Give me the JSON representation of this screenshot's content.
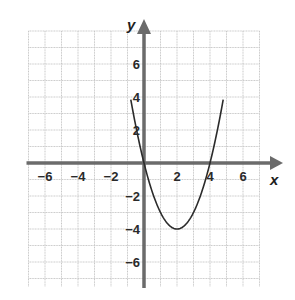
{
  "chart_data": {
    "type": "line",
    "title": "",
    "xlabel": "x",
    "ylabel": "y",
    "xlim": [
      -7,
      7
    ],
    "ylim": [
      -7.5,
      8
    ],
    "grid": true,
    "x_ticks": [
      -6,
      -4,
      -2,
      2,
      4,
      6
    ],
    "y_ticks": [
      -6,
      -4,
      -2,
      2,
      4,
      6
    ],
    "x_tick_labels": [
      "−6",
      "−4",
      "−2",
      "2",
      "4",
      "6"
    ],
    "y_tick_labels": [
      "−6",
      "−4",
      "−2",
      "2",
      "4",
      "6"
    ],
    "series": [
      {
        "name": "y = x^2 - 4x",
        "equation": "y = x^2 - 4x",
        "vertex": [
          2,
          -4
        ],
        "x_intercepts": [
          0,
          4
        ],
        "x": [
          -0.8,
          -0.5,
          0,
          0.5,
          1,
          1.5,
          2,
          2.5,
          3,
          3.5,
          4,
          4.5,
          4.8
        ],
        "values": [
          3.84,
          2.25,
          0,
          -1.75,
          -3,
          -3.75,
          -4,
          -3.75,
          -3,
          -1.75,
          0,
          2.25,
          3.84
        ]
      }
    ]
  },
  "colors": {
    "grid": "#c8c8c8",
    "axis": "#6b6b6b",
    "curve": "#2b2b2b",
    "text": "#2a2a2a"
  },
  "layout": {
    "origin_px": [
      144,
      163
    ],
    "unit_px": 16.5
  }
}
